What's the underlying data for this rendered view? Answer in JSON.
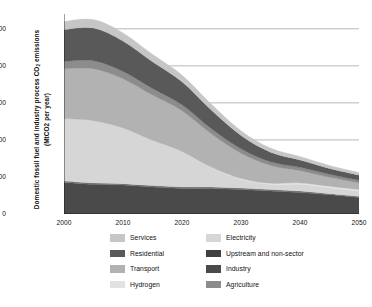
{
  "chart_data": {
    "type": "area",
    "stacked": true,
    "title": "",
    "xlabel": "",
    "ylabel": "Domestic fossil fuel and industry process CO2 emissions (MtCO2 per year)",
    "ylabel_line1": "Domestic fossil fuel and industry process CO",
    "ylabel_sub": "2",
    "ylabel_line1_end": " emissions",
    "ylabel_line2": "(MtCO2  per year)",
    "xlim": [
      2000,
      2050
    ],
    "ylim": [
      0,
      540
    ],
    "yticks": [
      0,
      100,
      200,
      300,
      400,
      500
    ],
    "ytick_labels": [
      "0",
      "100",
      "200",
      "300",
      "400",
      "500"
    ],
    "xticks": [
      2000,
      2010,
      2020,
      2030,
      2040,
      2050
    ],
    "xtick_labels": [
      "2000",
      "2010",
      "2020",
      "2030",
      "2040",
      "2050"
    ],
    "xminor_step": 5,
    "grid": "horizontal-only",
    "grid_color": "#9a9a9a",
    "legend_position": "bottom",
    "legend_columns": 2,
    "x": [
      2000,
      2005,
      2010,
      2015,
      2020,
      2025,
      2030,
      2035,
      2040,
      2045,
      2050
    ],
    "series": [
      {
        "name": "Industry",
        "color": "#4a4a4a",
        "order": 1,
        "values": [
          85,
          80,
          78,
          73,
          69,
          69,
          66,
          62,
          58,
          52,
          45
        ]
      },
      {
        "name": "Agriculture",
        "color": "#6e6e6e",
        "order": 2,
        "values": [
          4,
          4,
          4,
          4,
          4,
          4,
          4,
          4,
          4,
          3,
          3
        ]
      },
      {
        "name": "Electricity",
        "color": "#d6d6d6",
        "order": 3,
        "values": [
          168,
          168,
          150,
          122,
          96,
          52,
          24,
          14,
          18,
          16,
          14
        ]
      },
      {
        "name": "Hydrogen",
        "color": "#e2e2e2",
        "order": 4,
        "values": [
          0,
          0,
          0,
          0,
          0,
          1,
          2,
          3,
          4,
          4,
          4
        ]
      },
      {
        "name": "Transport",
        "color": "#b2b2b2",
        "order": 5,
        "values": [
          135,
          140,
          133,
          122,
          110,
          90,
          68,
          48,
          33,
          24,
          18
        ]
      },
      {
        "name": "Upstream and non-sector",
        "color": "#8c8c8c",
        "order": 6,
        "values": [
          20,
          22,
          20,
          18,
          16,
          14,
          12,
          10,
          9,
          8,
          7
        ],
        "note": "thin band above Transport"
      },
      {
        "name": "Residential",
        "color": "#595959",
        "order": 7,
        "values": [
          86,
          88,
          82,
          72,
          62,
          50,
          36,
          26,
          20,
          16,
          14
        ]
      },
      {
        "name": "Services",
        "color": "#c6c6c6",
        "order": 8,
        "values": [
          22,
          23,
          22,
          20,
          18,
          16,
          13,
          11,
          9,
          8,
          7
        ]
      }
    ],
    "totals": [
      520,
      525,
      489,
      431,
      375,
      296,
      225,
      178,
      155,
      131,
      112
    ]
  },
  "legend": {
    "rows": [
      {
        "left": {
          "label": "Services",
          "color": "#c6c6c6"
        },
        "right": {
          "label": "Electricity",
          "color": "#d6d6d6"
        }
      },
      {
        "left": {
          "label": "Residential",
          "color": "#595959"
        },
        "right": {
          "label": "Upstream and non-sector",
          "color": "#3f3f3f"
        }
      },
      {
        "left": {
          "label": "Transport",
          "color": "#b2b2b2"
        },
        "right": {
          "label": "Industry",
          "color": "#4a4a4a"
        }
      },
      {
        "left": {
          "label": "Hydrogen",
          "color": "#e2e2e2"
        },
        "right": {
          "label": "Agriculture",
          "color": "#8c8c8c"
        }
      }
    ]
  }
}
